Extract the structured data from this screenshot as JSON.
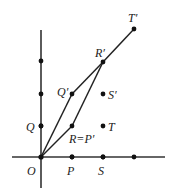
{
  "diagram": {
    "type": "coordinate-transformation",
    "origin": {
      "label": "O",
      "x": 41,
      "y": 157
    },
    "x_axis": {
      "x1": 12,
      "x2": 165,
      "y": 157,
      "tick_dots_x": [
        72,
        103,
        134
      ]
    },
    "y_axis": {
      "x": 41,
      "y1": 30,
      "y2": 188,
      "tick_dots_y": [
        61,
        94,
        126
      ]
    },
    "points": [
      {
        "id": "P",
        "label": "P",
        "x": 72,
        "y": 157,
        "lx": 67,
        "ly": 175
      },
      {
        "id": "S",
        "label": "S",
        "x": 103,
        "y": 157,
        "lx": 98,
        "ly": 175
      },
      {
        "id": "Q",
        "label": "Q",
        "x": 41,
        "y": 126,
        "lx": 26,
        "ly": 131
      },
      {
        "id": "T",
        "label": "T",
        "x": 103,
        "y": 126,
        "lx": 108,
        "ly": 131
      },
      {
        "id": "R",
        "label": "R=P′",
        "x": 72,
        "y": 126,
        "lx": 69,
        "ly": 143
      },
      {
        "id": "S_prime",
        "label": "S′",
        "x": 103,
        "y": 94,
        "lx": 108,
        "ly": 99
      },
      {
        "id": "Q_prime",
        "label": "Q′",
        "x": 72,
        "y": 94,
        "lx": 57,
        "ly": 96
      },
      {
        "id": "R_prime",
        "label": "R′",
        "x": 103,
        "y": 62,
        "lx": 95,
        "ly": 57
      },
      {
        "id": "T_prime",
        "label": "T′",
        "x": 134,
        "y": 29,
        "lx": 128,
        "ly": 22
      }
    ],
    "origin_label": {
      "text": "O",
      "lx": 27,
      "ly": 175
    },
    "segments": [
      {
        "from": "O",
        "to": "Q_prime"
      },
      {
        "from": "Q_prime",
        "to": "R_prime"
      },
      {
        "from": "O",
        "to": "R"
      },
      {
        "from": "R",
        "to": "R_prime"
      },
      {
        "from": "R_prime",
        "to": "T_prime"
      }
    ],
    "line_color": "#222222",
    "axis_color": "#333333"
  }
}
